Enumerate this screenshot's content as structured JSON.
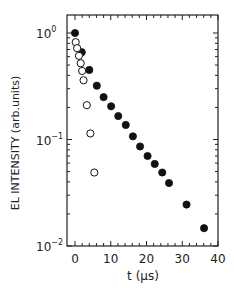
{
  "chart_data": {
    "type": "scatter",
    "title": "",
    "xlabel": "t (μs)",
    "ylabel": "EL INTENSITY (arb.units)",
    "xscale": "linear",
    "yscale": "log",
    "xlim": [
      -2.2,
      40
    ],
    "ylim": [
      0.01,
      1.48
    ],
    "x_ticks": [
      0,
      10,
      20,
      30,
      40
    ],
    "x_tick_labels": [
      "0",
      "10",
      "20",
      "30",
      "40"
    ],
    "y_ticks": [
      1,
      0.1,
      0.01
    ],
    "y_tick_labels": [
      {
        "base": "10",
        "exp": "0"
      },
      {
        "base": "10",
        "exp": "−1"
      },
      {
        "base": "10",
        "exp": "−2"
      }
    ],
    "grid": false,
    "legend": null,
    "series": [
      {
        "name": "filled circles",
        "marker": "filled-circle",
        "color": "#111111",
        "points": [
          [
            0.0,
            1.0
          ],
          [
            1.9,
            0.66
          ],
          [
            4.0,
            0.45
          ],
          [
            6.1,
            0.32
          ],
          [
            8.0,
            0.25
          ],
          [
            10.1,
            0.205
          ],
          [
            12.1,
            0.166
          ],
          [
            14.2,
            0.137
          ],
          [
            16.2,
            0.107
          ],
          [
            18.2,
            0.086
          ],
          [
            20.3,
            0.07
          ],
          [
            22.3,
            0.059
          ],
          [
            24.4,
            0.049
          ],
          [
            26.3,
            0.039
          ],
          [
            31.2,
            0.0245
          ],
          [
            36.1,
            0.0147
          ]
        ]
      },
      {
        "name": "open circles",
        "marker": "open-circle",
        "color": "#111111",
        "points": [
          [
            0.2,
            0.82
          ],
          [
            0.6,
            0.72
          ],
          [
            1.1,
            0.61
          ],
          [
            1.6,
            0.52
          ],
          [
            2.0,
            0.44
          ],
          [
            2.4,
            0.36
          ],
          [
            3.3,
            0.21
          ],
          [
            4.3,
            0.114
          ],
          [
            5.4,
            0.049
          ]
        ]
      }
    ]
  }
}
